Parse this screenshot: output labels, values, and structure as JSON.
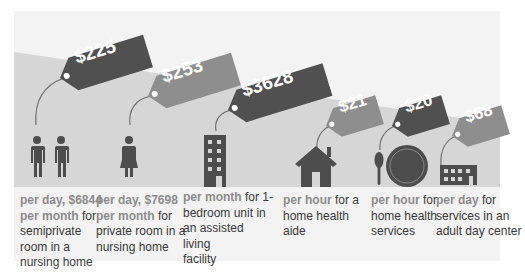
{
  "colors": {
    "panel_bg": "#f3f3f3",
    "band_bg": "#d6d6d6",
    "dark_tag": "#505050",
    "light_tag": "#8e8e8e",
    "icon": "#4d4d4d",
    "caption_text": "#3a3a3a",
    "highlight_text": "#8c8c8c"
  },
  "items": [
    {
      "price": "$225",
      "icon": "two-people-icon",
      "highlight1": "per day, $6844",
      "highlight2": "per month",
      "desc_a": " for",
      "desc_b": "semiprivate",
      "desc_c": "room in a",
      "desc_d": "nursing home"
    },
    {
      "price": "$253",
      "icon": "woman-icon",
      "highlight1": "per day, $7698",
      "highlight2": "per month",
      "desc_a": " for",
      "desc_b": "private room in a",
      "desc_c": "nursing home"
    },
    {
      "price": "$3628",
      "icon": "apartment-building-icon",
      "highlight1": "per month",
      "desc_a": " for 1-",
      "desc_b": "bedroom unit in",
      "desc_c": "an assisted living",
      "desc_d": "facility"
    },
    {
      "price": "$21",
      "icon": "house-icon",
      "highlight1": "per hour",
      "desc_a": " for a",
      "desc_b": "home health",
      "desc_c": "aide"
    },
    {
      "price": "$20",
      "icon": "plate-and-spoon-icon",
      "highlight1": "per hour",
      "desc_a": " for",
      "desc_b": "home health",
      "desc_c": "services"
    },
    {
      "price": "$68",
      "icon": "low-building-icon",
      "highlight1": "per day",
      "desc_a": " for",
      "desc_b": "services in an",
      "desc_c": "adult day center"
    }
  ]
}
